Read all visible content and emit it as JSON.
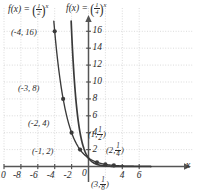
{
  "chart_data": {
    "type": "line",
    "title": "",
    "xlabel": "x",
    "ylabel": "",
    "xlim": [
      -11,
      7.6
    ],
    "ylim": [
      -1.6,
      17.2
    ],
    "grid": true,
    "x_ticks": [
      -10,
      -8,
      -6,
      -4,
      -2,
      0,
      4,
      6
    ],
    "x_tick_labels": [
      "-10",
      "-8",
      "-6",
      "-4",
      "-2",
      "0",
      "4",
      "6"
    ],
    "y_ticks": [
      2,
      4,
      6,
      8,
      10,
      12,
      14,
      16
    ],
    "y_tick_labels": [
      "2",
      "4",
      "6",
      "8",
      "10",
      "12",
      "14",
      "16"
    ],
    "series": [
      {
        "name": "f(x) = (1/2)^x",
        "base": 0.5,
        "label_tex": "f(x) = (1/2)^x",
        "x": [
          -4,
          -3,
          -2,
          -1,
          0,
          1,
          2,
          3,
          4,
          5,
          6,
          7
        ],
        "y": [
          16,
          8,
          4,
          2,
          1,
          0.5,
          0.25,
          0.125,
          0.0625,
          0.03125,
          0.015625,
          0.0078125
        ],
        "marked_points": [
          {
            "x": -4,
            "y": 16,
            "label": "(-4, 16)"
          },
          {
            "x": -3,
            "y": 8,
            "label": "(-3, 8)"
          },
          {
            "x": -2,
            "y": 4,
            "label": "(-2, 4)"
          },
          {
            "x": -1,
            "y": 2,
            "label": "(-1, 2)"
          },
          {
            "x": 1,
            "y": 0.5,
            "label": "(1, 1/2)"
          },
          {
            "x": 2,
            "y": 0.25,
            "label": "(2, 1/4)"
          },
          {
            "x": 3,
            "y": 0.125,
            "label": "(3, 1/8)"
          }
        ]
      },
      {
        "name": "f(x) = (1/4)^x",
        "base": 0.25,
        "label_tex": "f(x) = (1/4)^x",
        "x": [
          -2,
          -1.5,
          -1,
          -0.5,
          0,
          0.5,
          1,
          2,
          3,
          4,
          5,
          6,
          7
        ],
        "y": [
          16,
          8,
          4,
          2,
          1,
          0.5,
          0.25,
          0.0625,
          0.015625,
          0.00390625,
          0.0009765625,
          0.000244140625,
          6.103515625e-05
        ],
        "marked_points": []
      }
    ]
  },
  "labels": {
    "curve1_fx": "f(x)",
    "curve1_eq": "=",
    "curve1_num": "1",
    "curve1_den": "2",
    "curve1_exp": "x",
    "curve2_fx": "f(x)",
    "curve2_eq": "=",
    "curve2_num": "1",
    "curve2_den": "4",
    "curve2_exp": "x",
    "x_axis_name": "x"
  },
  "points": {
    "p_neg4": "(-4, 16)",
    "p_neg3": "(-3, 8)",
    "p_neg2": "(-2, 4)",
    "p_neg1": "(-1, 2)",
    "p1_open": "(1,",
    "p1_num": "1",
    "p1_den": "2",
    "p1_close": ")",
    "p2_open": "(2,",
    "p2_num": "1",
    "p2_den": "4",
    "p2_close": ")",
    "p3_open": "(3,",
    "p3_num": "1",
    "p3_den": "8",
    "p3_close": ")"
  },
  "ticks": {
    "x": [
      "-10",
      "-8",
      "-6",
      "-4",
      "-2",
      "0",
      "4",
      "6"
    ],
    "y": [
      "16",
      "14",
      "12",
      "10",
      "8",
      "6",
      "4",
      "2"
    ]
  },
  "colors": {
    "grid": "#d7d7d7",
    "axis": "#555555",
    "curve": "#3a3a3a",
    "text": "#2b2b2b",
    "background": "#ffffff"
  }
}
